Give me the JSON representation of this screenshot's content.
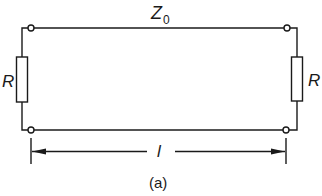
{
  "diagram": {
    "caption": "(a)",
    "impedance_label": {
      "symbol": "Z",
      "subscript": "0"
    },
    "resistor_left_label": "R",
    "resistor_right_label": "R",
    "length_label": "l",
    "colors": {
      "line": "#1a1a1a",
      "background": "#ffffff"
    },
    "components": [
      {
        "id": "resistor-left",
        "type": "resistor",
        "label": "R"
      },
      {
        "id": "resistor-right",
        "type": "resistor",
        "label": "R"
      },
      {
        "id": "line-top",
        "type": "conductor"
      },
      {
        "id": "line-bottom",
        "type": "conductor"
      },
      {
        "id": "terminal-top-left",
        "type": "terminal"
      },
      {
        "id": "terminal-top-right",
        "type": "terminal"
      },
      {
        "id": "terminal-bottom-left",
        "type": "terminal"
      },
      {
        "id": "terminal-bottom-right",
        "type": "terminal"
      },
      {
        "id": "dimension-length",
        "type": "dimension-arrow",
        "label": "l"
      }
    ]
  }
}
